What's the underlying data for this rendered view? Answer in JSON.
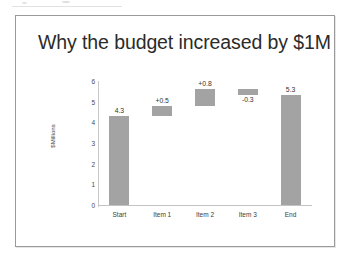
{
  "slide": {
    "title": "Why the budget increased by $1M"
  },
  "chart_data": {
    "type": "bar",
    "subtype": "waterfall",
    "title": "Why the budget increased by $1M",
    "xlabel": "",
    "ylabel": "$Millions",
    "ylim": [
      0,
      6
    ],
    "yticks": [
      "0",
      "1",
      "2",
      "3",
      "4",
      "5",
      "6"
    ],
    "grid": false,
    "legend": false,
    "categories": [
      "Start",
      "Item 1",
      "Item 2",
      "Item 3",
      "End"
    ],
    "labels": [
      "4.3",
      "+0.5",
      "+0.8",
      "-0.3",
      "5.3"
    ],
    "values": [
      4.3,
      0.5,
      0.8,
      -0.3,
      5.3
    ],
    "bar_bottoms": [
      0,
      4.3,
      4.8,
      5.3,
      0
    ],
    "bar_tops": [
      4.3,
      4.8,
      5.6,
      5.6,
      5.3
    ],
    "label_positions": [
      "above",
      "above",
      "above",
      "below",
      "above"
    ],
    "bar_color": "#a3a3a3",
    "axis_color": "#c3c3c3",
    "background": "#ffffff"
  }
}
